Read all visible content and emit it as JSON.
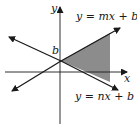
{
  "diagram": {
    "type": "coordinate-plane-linear-inequality",
    "axes": {
      "x_label": "x",
      "y_label": "y"
    },
    "intercept_label": "b",
    "lines": [
      {
        "id": "upper",
        "equation": "y = mx + b"
      },
      {
        "id": "lower",
        "equation": "y = nx + b"
      }
    ],
    "shaded_region": "between lines to the right of y-axis",
    "colors": {
      "stroke": "#1a1a1a",
      "shade": "#8c8c8c",
      "background": "#ffffff"
    }
  }
}
